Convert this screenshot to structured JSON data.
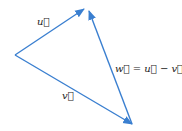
{
  "diagram": {
    "color": "#3a7fd0",
    "labels": {
      "u": "u⃗",
      "v": "v⃗",
      "w": "w⃗ = u⃗ − v⃗"
    },
    "vectors": [
      {
        "name": "u",
        "from": [
          15,
          55
        ],
        "to": [
          84,
          9
        ]
      },
      {
        "name": "v",
        "from": [
          15,
          55
        ],
        "to": [
          132,
          124
        ]
      },
      {
        "name": "w",
        "from": [
          132,
          124
        ],
        "to": [
          89,
          11
        ]
      }
    ]
  }
}
